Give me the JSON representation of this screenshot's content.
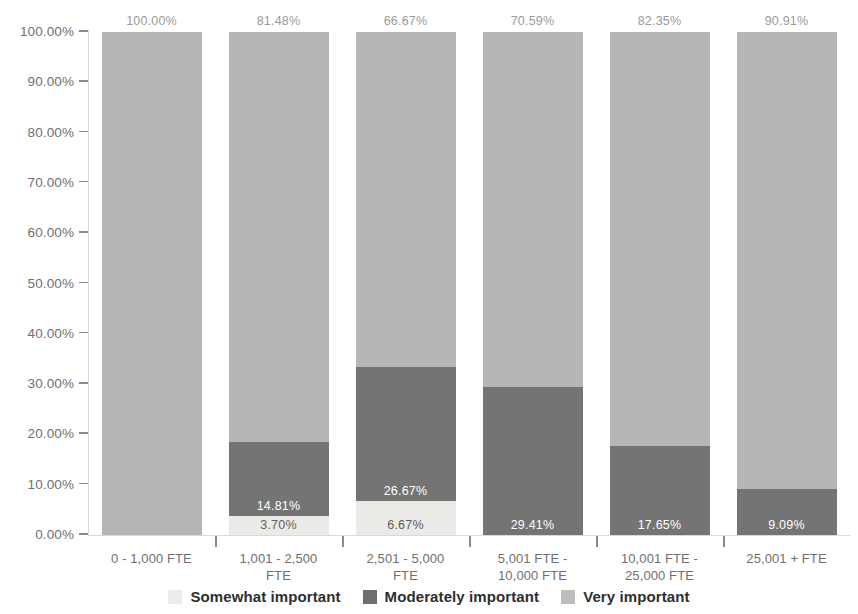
{
  "chart_data": {
    "type": "bar",
    "subtype": "stacked-bar-100",
    "title": "",
    "xlabel": "",
    "ylabel": "",
    "ylim": [
      0,
      100
    ],
    "ytick_labels": [
      "0.00%",
      "10.00%",
      "20.00%",
      "30.00%",
      "40.00%",
      "50.00%",
      "60.00%",
      "70.00%",
      "80.00%",
      "90.00%",
      "100.00%"
    ],
    "ytick_values": [
      0,
      10,
      20,
      30,
      40,
      50,
      60,
      70,
      80,
      90,
      100
    ],
    "grid": false,
    "legend_position": "bottom",
    "categories": [
      "0 - 1,000 FTE",
      "1,001 - 2,500 FTE",
      "2,501 - 5,000 FTE",
      "5,001 FTE - 10,000 FTE",
      "10,001 FTE - 25,000 FTE",
      "25,001 + FTE"
    ],
    "series": [
      {
        "name": "Very important",
        "color": "#eceae6",
        "values": [
          0,
          3.7,
          6.67,
          0,
          0,
          0
        ],
        "labels": [
          "",
          "3.70%",
          "6.67%",
          "",
          "",
          ""
        ]
      },
      {
        "name": "Moderately important",
        "color": "#747474",
        "values": [
          0,
          14.81,
          26.67,
          29.41,
          17.65,
          9.09
        ],
        "labels": [
          "",
          "14.81%",
          "26.67%",
          "29.41%",
          "17.65%",
          "9.09%"
        ]
      },
      {
        "name": "Somewhat important",
        "color": "#b6b6b6",
        "values": [
          100.0,
          81.48,
          66.67,
          70.59,
          82.35,
          90.91
        ],
        "labels": [
          "100.00%",
          "81.48%",
          "66.67%",
          "70.59%",
          "82.35%",
          "90.91%"
        ]
      }
    ]
  },
  "axis": {
    "y_ticks": [
      {
        "label": "100.00%",
        "value": 100
      },
      {
        "label": "90.00%",
        "value": 90
      },
      {
        "label": "80.00%",
        "value": 80
      },
      {
        "label": "70.00%",
        "value": 70
      },
      {
        "label": "60.00%",
        "value": 60
      },
      {
        "label": "50.00%",
        "value": 50
      },
      {
        "label": "40.00%",
        "value": 40
      },
      {
        "label": "30.00%",
        "value": 30
      },
      {
        "label": "20.00%",
        "value": 20
      },
      {
        "label": "10.00%",
        "value": 10
      },
      {
        "label": "0.00%",
        "value": 0
      }
    ]
  },
  "categories": [
    {
      "line1": "0 - 1,000 FTE",
      "line2": ""
    },
    {
      "line1": "1,001 - 2,500",
      "line2": "FTE"
    },
    {
      "line1": "2,501 - 5,000",
      "line2": "FTE"
    },
    {
      "line1": "5,001 FTE -",
      "line2": "10,000 FTE"
    },
    {
      "line1": "10,001 FTE -",
      "line2": "25,000 FTE"
    },
    {
      "line1": "25,001 + FTE",
      "line2": ""
    }
  ],
  "legend": {
    "items": [
      {
        "label": "Somewhat important",
        "color": "#eeece8"
      },
      {
        "label": "Moderately important",
        "color": "#6e6e6e"
      },
      {
        "label": "Very important",
        "color": "#bdbdbd"
      }
    ]
  },
  "colors": {
    "somewhat_important": "#b6b6b6",
    "moderately_important": "#747474",
    "very_important": "#eceae6",
    "axis_text": "#6f6f6f",
    "total_label": "#9a9a9a",
    "axis_line": "#d9d9d9",
    "background": "#ffffff"
  }
}
